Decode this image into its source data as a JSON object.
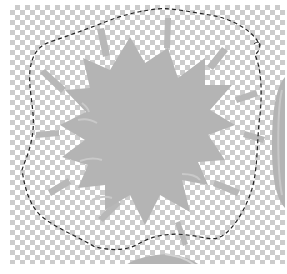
{
  "canvas": {
    "description": "transparent layer with starburst artwork and lasso selection",
    "checker_light": "#ffffff",
    "checker_dark": "#cccccc",
    "shape_color": "#b4b4b4",
    "shape_highlight": "#c8c8c8",
    "selection_color": "#222222"
  },
  "layers": {
    "starburst": "starburst-shape",
    "rays": "burst-rays",
    "selection": "lasso-selection",
    "partial_right": "partial-shape-right",
    "partial_bottom": "partial-shape-bottom"
  }
}
